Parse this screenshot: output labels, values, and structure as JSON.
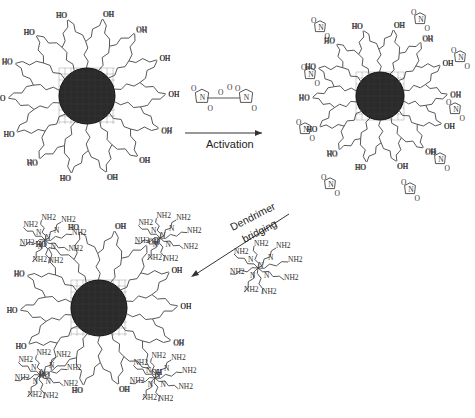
{
  "diagram": {
    "steps": [
      {
        "id": "hydroxyl-nanoparticle",
        "terminal_group": "OH",
        "alt_label": "HO"
      },
      {
        "id": "activated-nanoparticle",
        "terminal_group": "OH"
      },
      {
        "id": "dendrimer-bridged-nanoparticle",
        "terminal_group": "NH2"
      }
    ],
    "reagent": {
      "atoms": [
        "O",
        "N",
        "O",
        "O",
        "O",
        "N",
        "O",
        "O"
      ]
    },
    "arrows": [
      {
        "label": "Activation"
      },
      {
        "label_line1": "Dendrimer",
        "label_line2": "bridging"
      }
    ],
    "dendrimer": {
      "atoms": [
        "NH2",
        "N",
        "NH2",
        "NH2"
      ]
    },
    "colors": {
      "core": "#2a2a2a",
      "line": "#444444",
      "text": "#222222"
    }
  }
}
